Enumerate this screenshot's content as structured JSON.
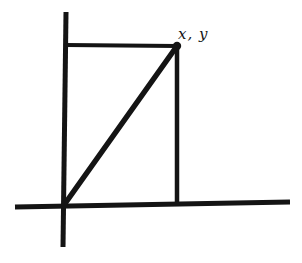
{
  "figure": {
    "kind": "hand-drawn-coordinate-sketch",
    "background_color": "#ffffff",
    "ink_color": "#141414",
    "width": 302,
    "height": 263,
    "labels": {
      "vertex_label": "x, y"
    },
    "geometry": {
      "origin": {
        "x": 64,
        "y": 205
      },
      "vertex": {
        "x": 177,
        "y": 46
      },
      "y_axis": {
        "x1": 66,
        "y1": 12,
        "x2": 63,
        "y2": 247,
        "stroke_width": 5
      },
      "x_axis": {
        "x1": 15,
        "y1": 207,
        "x2": 290,
        "y2": 202,
        "stroke_width": 5
      },
      "top_segment": {
        "x1": 66,
        "y1": 45,
        "x2": 177,
        "y2": 46,
        "stroke_width": 4
      },
      "right_segment": {
        "x1": 177,
        "y1": 46,
        "x2": 177,
        "y2": 205,
        "stroke_width": 4.5
      },
      "hypotenuse": {
        "x1": 64,
        "y1": 205,
        "x2": 177,
        "y2": 46,
        "stroke_width": 5.5
      },
      "vertex_dot": {
        "cx": 177,
        "cy": 46,
        "r": 4.2
      },
      "label_position": {
        "left": 178,
        "top": 25
      }
    }
  }
}
